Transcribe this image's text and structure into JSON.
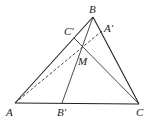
{
  "diagram": {
    "type": "geometry",
    "points": {
      "A": {
        "label": "A",
        "x": 15,
        "y": 103
      },
      "B": {
        "label": "B",
        "x": 93,
        "y": 17
      },
      "C": {
        "label": "C",
        "x": 139,
        "y": 104
      },
      "A_prime": {
        "label": "A'",
        "x": 102,
        "y": 31
      },
      "B_prime": {
        "label": "B'",
        "x": 62,
        "y": 103
      },
      "C_prime": {
        "label": "C'",
        "x": 74,
        "y": 38
      },
      "M": {
        "label": "M",
        "x": 82,
        "y": 46
      }
    },
    "segments": [
      {
        "from": "A",
        "to": "B",
        "style": "solid"
      },
      {
        "from": "B",
        "to": "C",
        "style": "solid"
      },
      {
        "from": "A",
        "to": "C",
        "style": "solid"
      },
      {
        "from": "B",
        "to": "B_prime",
        "style": "solid"
      },
      {
        "from": "C",
        "to": "C_prime",
        "style": "solid"
      },
      {
        "from": "A",
        "to": "A_prime",
        "style": "dashed"
      }
    ]
  }
}
